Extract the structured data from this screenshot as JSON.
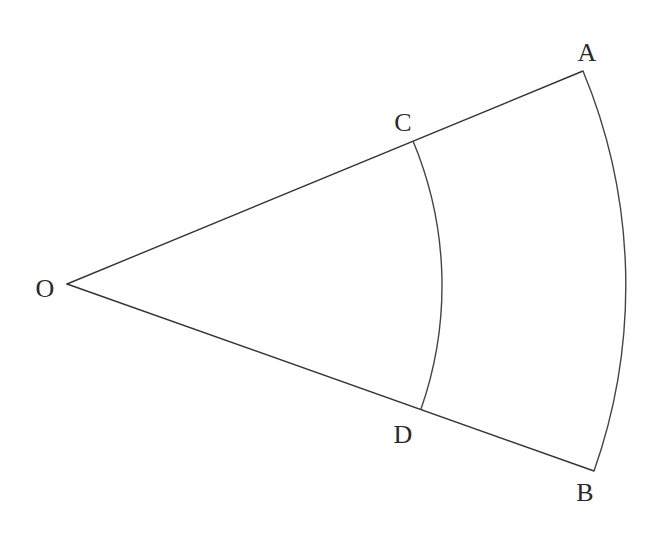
{
  "diagram": {
    "type": "sector-with-concentric-arcs",
    "points": {
      "O": {
        "label": "O",
        "x": 67,
        "y": 284,
        "label_x": 45,
        "label_y": 297
      },
      "A": {
        "label": "A",
        "x": 583,
        "y": 71,
        "label_x": 587,
        "label_y": 61
      },
      "B": {
        "label": "B",
        "x": 594,
        "y": 471,
        "label_x": 585,
        "label_y": 501
      },
      "C": {
        "label": "C",
        "x": 413,
        "y": 141,
        "label_x": 403,
        "label_y": 131
      },
      "D": {
        "label": "D",
        "x": 421,
        "y": 409,
        "label_x": 403,
        "label_y": 443
      }
    },
    "segments": [
      {
        "from": "O",
        "to": "A"
      },
      {
        "from": "O",
        "to": "B"
      }
    ],
    "arcs": [
      {
        "name": "arc-AB",
        "from": "A",
        "to": "B",
        "center": "O",
        "radius": 558
      },
      {
        "name": "arc-CD",
        "from": "C",
        "to": "D",
        "center": "O",
        "radius": 374
      }
    ],
    "colors": {
      "line": "#333333",
      "text": "#2a2a2a",
      "background": "#ffffff"
    }
  }
}
